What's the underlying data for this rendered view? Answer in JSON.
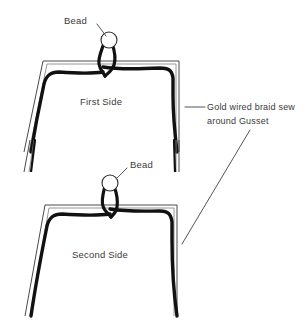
{
  "diagram": {
    "background_color": "#ffffff",
    "ink_color": "#111111",
    "text_color": "#3a3a3a",
    "gusset_line_color": "#4a4a4a",
    "leader_line_color": "#55555a"
  },
  "labels": {
    "bead_top": "Bead",
    "bead_bottom": "Bead",
    "first_side": "First Side",
    "second_side": "Second Side",
    "braid_line1": "Gold wired braid sew",
    "braid_line2": "around Gusset"
  },
  "parts": [
    {
      "name": "bead-top",
      "label": "Bead"
    },
    {
      "name": "first-side-panel",
      "label": "First Side"
    },
    {
      "name": "bead-bottom",
      "label": "Bead"
    },
    {
      "name": "second-side-panel",
      "label": "Second Side"
    },
    {
      "name": "gold-wired-braid",
      "label": "Gold wired braid sew around Gusset"
    }
  ]
}
